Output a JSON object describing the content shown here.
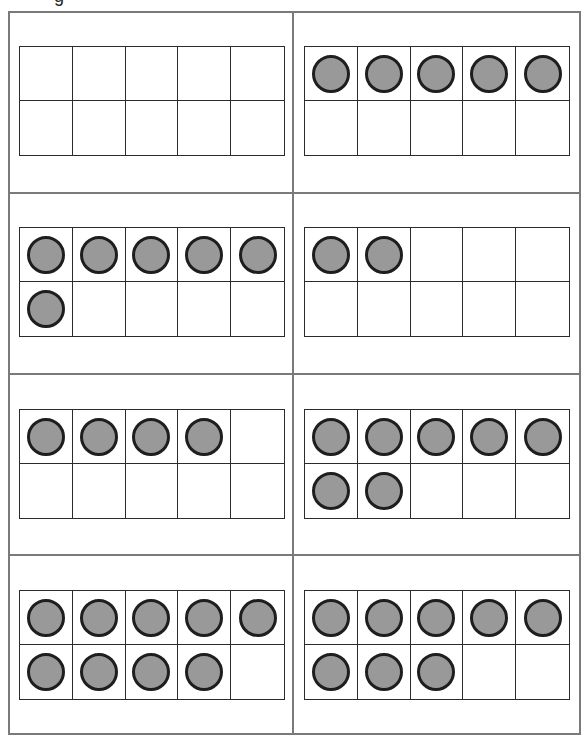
{
  "worksheet": {
    "heading_fragment": "g",
    "colors": {
      "border": "#7a7a7a",
      "grid_line": "#2b2b2b",
      "counter_fill": "#999999",
      "counter_outline": "#1e1e1e"
    },
    "layout": {
      "rows": 4,
      "columns": 2,
      "frame_rows": 2,
      "frame_columns": 5
    },
    "ten_frames": [
      {
        "position": "row-1-left",
        "filled": 0
      },
      {
        "position": "row-1-right",
        "filled": 5
      },
      {
        "position": "row-2-left",
        "filled": 6
      },
      {
        "position": "row-2-right",
        "filled": 2
      },
      {
        "position": "row-3-left",
        "filled": 4
      },
      {
        "position": "row-3-right",
        "filled": 7
      },
      {
        "position": "row-4-left",
        "filled": 9
      },
      {
        "position": "row-4-right",
        "filled": 8
      }
    ]
  }
}
